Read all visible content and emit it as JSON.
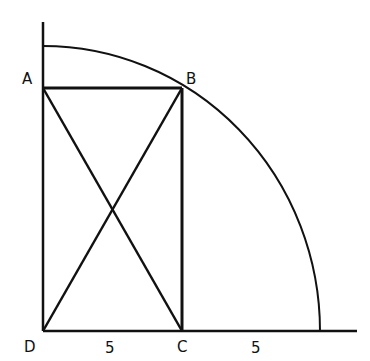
{
  "diagram": {
    "points": {
      "A": "A",
      "B": "B",
      "C": "C",
      "D": "D"
    },
    "segment_labels": {
      "DC": "5",
      "C_to_arc": "5"
    },
    "stroke_color": "#111111",
    "background": "#ffffff"
  }
}
